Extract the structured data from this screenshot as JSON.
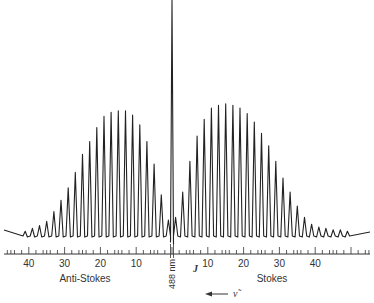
{
  "chart_data": {
    "type": "line",
    "title": "",
    "subtitle": "Rotational Raman spectrum",
    "xlabel": "J",
    "ylabel": "",
    "excitation_label": "488 nm",
    "direction_label": "ν̃",
    "regions": [
      {
        "name": "Anti-Stokes",
        "side": "left"
      },
      {
        "name": "Stokes",
        "side": "right"
      }
    ],
    "x_ticks_anti_stokes": [
      40,
      30,
      20,
      10
    ],
    "x_ticks_stokes": [
      10,
      20,
      30,
      40
    ],
    "grid": false,
    "legend": null,
    "rayleigh_line": {
      "position": 0,
      "relative_height": 1.0
    },
    "series": [
      {
        "name": "Anti-Stokes",
        "J": [
          1,
          3,
          5,
          7,
          9,
          11,
          13,
          15,
          17,
          19,
          21,
          23,
          25,
          27,
          29,
          31,
          33,
          35,
          37,
          39,
          41
        ],
        "relative_intensity": [
          0.1,
          0.28,
          0.5,
          0.66,
          0.78,
          0.85,
          0.88,
          0.88,
          0.87,
          0.84,
          0.76,
          0.66,
          0.57,
          0.44,
          0.33,
          0.24,
          0.16,
          0.09,
          0.06,
          0.04,
          0.02
        ]
      },
      {
        "name": "Stokes",
        "J": [
          1,
          3,
          5,
          7,
          9,
          11,
          13,
          15,
          17,
          19,
          21,
          23,
          25,
          27,
          29,
          31,
          33,
          35,
          37,
          39,
          41,
          43,
          45,
          47,
          49
        ],
        "relative_intensity": [
          0.12,
          0.3,
          0.52,
          0.7,
          0.82,
          0.9,
          0.92,
          0.93,
          0.92,
          0.9,
          0.86,
          0.8,
          0.72,
          0.63,
          0.52,
          0.4,
          0.3,
          0.2,
          0.12,
          0.07,
          0.05,
          0.04,
          0.03,
          0.03,
          0.02
        ]
      }
    ]
  },
  "labels": {
    "anti_stokes": "Anti-Stokes",
    "stokes": "Stokes",
    "j_axis": "J",
    "laser": "488 nm",
    "wavenumber": "ν̃"
  }
}
